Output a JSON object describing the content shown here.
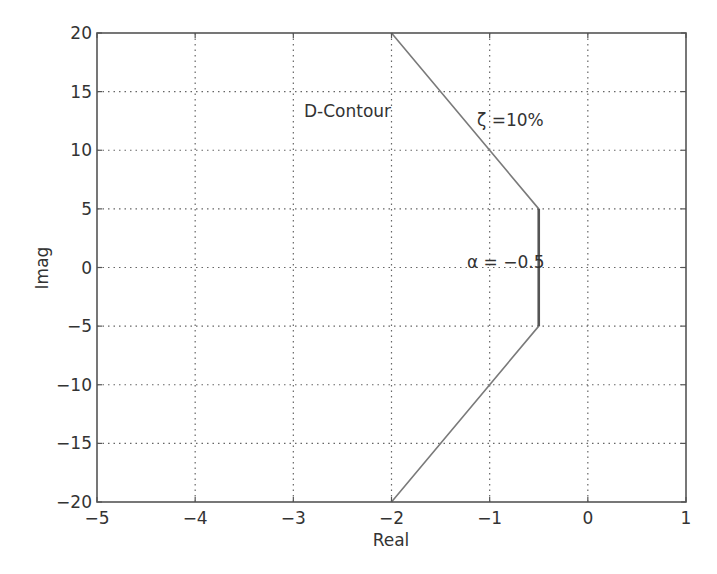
{
  "chart_data": {
    "type": "line",
    "title": "",
    "xlabel": "Real",
    "ylabel": "Imag",
    "xlim": [
      -5,
      1
    ],
    "ylim": [
      -20,
      20
    ],
    "xticks": [
      -5,
      -4,
      -3,
      -2,
      -1,
      0,
      1
    ],
    "yticks": [
      -20,
      -15,
      -10,
      -5,
      0,
      5,
      10,
      15,
      20
    ],
    "xtick_labels": [
      "−5",
      "−4",
      "−3",
      "−2",
      "−1",
      "0",
      "1"
    ],
    "ytick_labels": [
      "−20",
      "−15",
      "−10",
      "−5",
      "0",
      "5",
      "10",
      "15",
      "20"
    ],
    "grid": true,
    "legend": null,
    "series": [
      {
        "name": "D-Contour",
        "x": [
          -2,
          -0.5,
          -0.5,
          -2
        ],
        "y": [
          20,
          5,
          -5,
          -20
        ],
        "color": "#7a7a7a"
      }
    ],
    "highlight_segment": {
      "x": [
        -0.5,
        -0.5
      ],
      "y": [
        5,
        -5
      ],
      "color": "#555555"
    },
    "annotations": [
      {
        "text": "D-Contour",
        "x": -2.9,
        "y": 13.4
      },
      {
        "text": "ζ =10%",
        "x": -1.4,
        "y": 12.5
      },
      {
        "text": "α = −0.5",
        "x": -1.25,
        "y": 0.1
      }
    ]
  },
  "labels": {
    "xlabel": "Real",
    "ylabel": "Imag",
    "annotation_dcontour": "D-Contour",
    "annotation_zeta": "ζ =10%",
    "annotation_alpha": "α = −0.5"
  },
  "colors": {
    "frame": "#555555",
    "grid": "#666666",
    "line": "#7a7a7a",
    "text": "#333333"
  }
}
